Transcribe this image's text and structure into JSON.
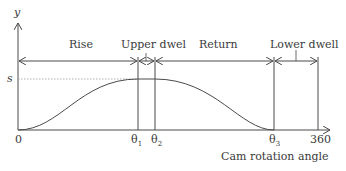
{
  "diagram": {
    "type": "cam displacement diagram",
    "axis": {
      "y_label": "y",
      "x_label": "Cam rotation angle",
      "y_level_label": "s",
      "origin_label": "0",
      "x_ticks": [
        {
          "base": "θ",
          "sub": "1"
        },
        {
          "base": "θ",
          "sub": "2"
        },
        {
          "base": "θ",
          "sub": "3"
        },
        {
          "base": "360",
          "sub": ""
        }
      ]
    },
    "segments": [
      {
        "label": "Rise"
      },
      {
        "label": "Upper dwel"
      },
      {
        "label": "Return"
      },
      {
        "label": "Lower dwell"
      }
    ],
    "colors": {
      "line": "#4a4a4a",
      "text": "#3a3a3a",
      "background": "#ffffff"
    }
  }
}
